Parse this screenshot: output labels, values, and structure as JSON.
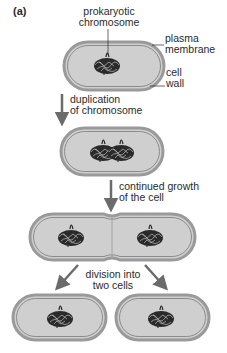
{
  "panel_label": "(a)",
  "labels": {
    "chromosome": [
      "prokaryotic",
      "chromosome"
    ],
    "plasma_membrane": [
      "plasma",
      "membrane"
    ],
    "cell_wall": [
      "cell",
      "wall"
    ]
  },
  "steps": [
    {
      "lines": [
        "duplication",
        "of chromosome"
      ]
    },
    {
      "lines": [
        "continued growth",
        "of the cell"
      ]
    },
    {
      "lines": [
        "division into",
        "two cells"
      ]
    }
  ],
  "colors": {
    "cytoplasm": "#cfcfcf",
    "wall": "#9a9a9a",
    "membrane": "#7a7a7a",
    "arrow": "#6b6b6b",
    "dna": "#1e1e1e"
  }
}
